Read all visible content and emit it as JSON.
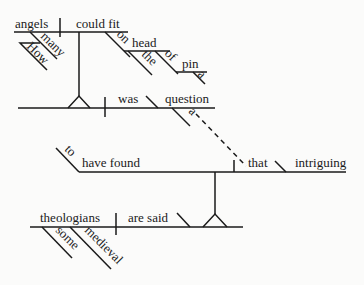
{
  "diagram": {
    "type": "Reed-Kellogg sentence diagram",
    "sentence_words": {
      "main_clause": {
        "subject": "theologians",
        "subject_modifiers": [
          "some",
          "medieval"
        ],
        "verb": "are said",
        "infinitive_marker": "to",
        "infinitive_verb": "have found",
        "object": "that",
        "object_complement": "intriguing"
      },
      "noun_clause": {
        "subject": "angels",
        "subject_modifiers": [
          "many",
          "How"
        ],
        "verb": "could fit",
        "preposition_1": "on",
        "prep_object_1": "head",
        "prep_object_1_modifier": "the",
        "preposition_2": "of",
        "prep_object_2": "pin",
        "prep_object_2_modifier": "a"
      },
      "appositive_clause": {
        "verb": "was",
        "predicate_noun": "question",
        "predicate_modifier": "a"
      }
    },
    "colors": {
      "line": "#1a1a1a",
      "background": "#fbfbfa"
    }
  }
}
